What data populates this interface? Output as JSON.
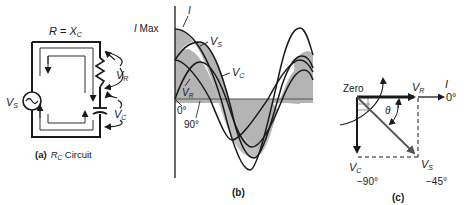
{
  "panel_a": {
    "title_equation": {
      "lhs": "R",
      "eq": " = ",
      "rhs": "X",
      "rhs_sub": "C"
    },
    "source_label": {
      "main": "V",
      "sub": "S"
    },
    "resistor_label": {
      "main": "V",
      "sub": "R"
    },
    "capacitor_label": {
      "main": "V",
      "sub": "C"
    },
    "caption": {
      "prefix": "(a)",
      "main": "R",
      "sub": "C",
      "suffix": " Circuit"
    }
  },
  "panel_b": {
    "imax_label": {
      "main": "I",
      "suffix": " Max"
    },
    "i_label": "I",
    "vs_label": {
      "main": "V",
      "sub": "S"
    },
    "vc_label": {
      "main": "V",
      "sub": "C"
    },
    "vr_label": {
      "main": "V",
      "sub": "R"
    },
    "deg0": "0°",
    "deg90": "90°",
    "caption": "(b)"
  },
  "panel_c": {
    "zero_label": "Zero",
    "vr_label": {
      "main": "V",
      "sub": "R"
    },
    "i_label": "I",
    "deg0": "0°",
    "theta": "θ",
    "vc_label": {
      "main": "V",
      "sub": "C"
    },
    "vs_label": {
      "main": "V",
      "sub": "S"
    },
    "deg_minus90": "−90°",
    "deg_minus45": "−45°",
    "caption": "(c)"
  },
  "colors": {
    "ink": "#1a1a1a",
    "shade": "#b4b4b4",
    "phasor_vs": "#555555"
  }
}
